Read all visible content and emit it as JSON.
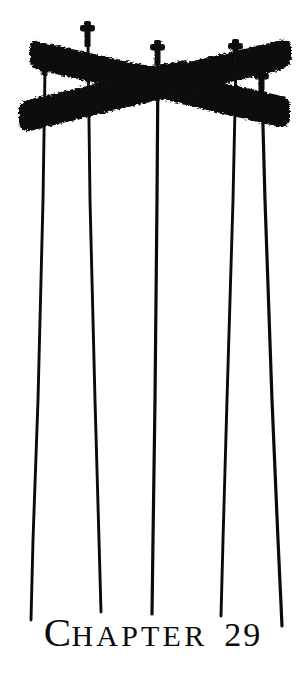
{
  "page": {
    "type": "book-chapter-opening-page",
    "background_color": "#ffffff",
    "ink_color": "#0b0b0d"
  },
  "heading": {
    "drop_cap": "C",
    "rest_of_word": "hapter",
    "number": "29",
    "full_text": "CHAPTER 29",
    "style": "small-caps serif with enlarged initial"
  },
  "illustration": {
    "name": "crossed-utility-pole-crossarms-with-wires",
    "description": "Black silhouette of two wooden utility pole crossarms crossing in an X, fitted with insulator pins, with five wires hanging straight down",
    "ink_color": "#0b0b0d",
    "crossarms": [
      {
        "name": "upper-crossarm",
        "orientation": "descending-left-to-right",
        "left_end": [
          34,
          48
        ],
        "right_end": [
          283,
          112
        ],
        "thickness": 21
      },
      {
        "name": "lower-crossarm",
        "orientation": "ascending-left-to-right",
        "left_end": [
          30,
          104
        ],
        "right_end": [
          287,
          54
        ],
        "thickness": 21
      }
    ],
    "insulator_pins": [
      {
        "name": "pin-1",
        "x": 45,
        "y": 74
      },
      {
        "name": "pin-2",
        "x": 88,
        "y": 44
      },
      {
        "name": "pin-3",
        "x": 158,
        "y": 62
      },
      {
        "name": "pin-4",
        "x": 236,
        "y": 62
      },
      {
        "name": "pin-5",
        "x": 262,
        "y": 92
      }
    ],
    "wires": [
      {
        "name": "wire-1",
        "top": [
          45,
          78
        ],
        "bottom": [
          31,
          618
        ]
      },
      {
        "name": "wire-2",
        "top": [
          88,
          49
        ],
        "bottom": [
          100,
          610
        ]
      },
      {
        "name": "wire-3",
        "top": [
          158,
          66
        ],
        "bottom": [
          152,
          612
        ]
      },
      {
        "name": "wire-4",
        "top": [
          236,
          66
        ],
        "bottom": [
          221,
          614
        ]
      },
      {
        "name": "wire-5",
        "top": [
          262,
          96
        ],
        "bottom": [
          282,
          624
        ]
      }
    ],
    "wire_count": 5
  }
}
